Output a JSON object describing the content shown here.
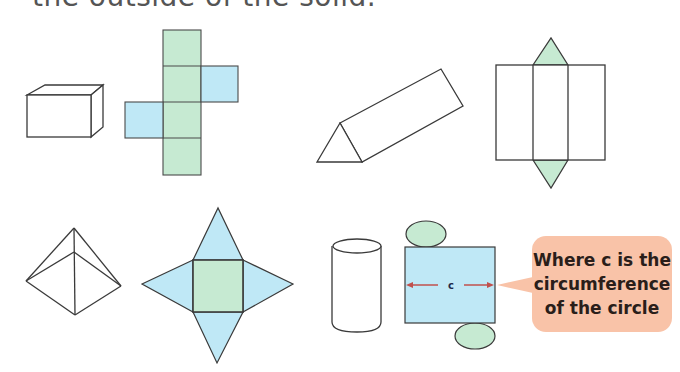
{
  "caption": "the outside of the solid.",
  "colors": {
    "green_face": "#c6ead2",
    "blue_face": "#bfe8f6",
    "outline": "#3a3a3a",
    "callout_bg": "#f9c3a8",
    "arrow": "#c0504d"
  },
  "figures": [
    {
      "solid": "cube",
      "net": "cube-net"
    },
    {
      "solid": "triangular-prism",
      "net": "triangular-prism-net"
    },
    {
      "solid": "square-pyramid",
      "net": "square-pyramid-net"
    },
    {
      "solid": "cylinder",
      "net": "cylinder-net"
    }
  ],
  "cylinder_net": {
    "dimension_label": "c"
  },
  "callout": {
    "lines": [
      "Where c is the",
      "circumference",
      "of the circle"
    ]
  }
}
